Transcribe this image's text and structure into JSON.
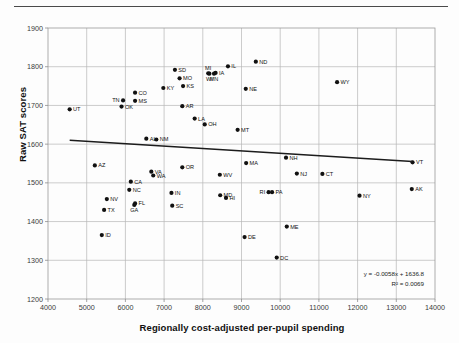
{
  "chart_data": {
    "type": "scatter",
    "title": "",
    "xlabel": "Regionally cost-adjusted per-pupil spending",
    "ylabel": "Raw SAT scores",
    "xlim": [
      4000,
      14000
    ],
    "ylim": [
      1200,
      1900
    ],
    "xticks": [
      4000,
      5000,
      6000,
      7000,
      8000,
      9000,
      10000,
      11000,
      12000,
      13000,
      14000
    ],
    "yticks": [
      1200,
      1300,
      1400,
      1500,
      1600,
      1700,
      1800,
      1900
    ],
    "grid": true,
    "legend": "none",
    "annotations": {
      "trendline_equation": "y = -0.0058x + 1636.8",
      "r_squared": "R² = 0.0069"
    },
    "trendline": {
      "slope": -0.0058,
      "intercept": 1636.8,
      "x_start": 4560,
      "y_start": 1610,
      "x_end": 13420,
      "y_end": 1555
    },
    "point_label_key": "state",
    "points": [
      {
        "state": "UT",
        "x": 4560,
        "y": 1690,
        "label_side": "right"
      },
      {
        "state": "AZ",
        "x": 5210,
        "y": 1545,
        "label_side": "right"
      },
      {
        "state": "NV",
        "x": 5520,
        "y": 1458,
        "label_side": "right"
      },
      {
        "state": "TX",
        "x": 5450,
        "y": 1430,
        "label_side": "right"
      },
      {
        "state": "ID",
        "x": 5390,
        "y": 1365,
        "label_side": "right"
      },
      {
        "state": "TN",
        "x": 5940,
        "y": 1713,
        "label_side": "left"
      },
      {
        "state": "OK",
        "x": 5900,
        "y": 1697,
        "label_side": "right"
      },
      {
        "state": "MS",
        "x": 6250,
        "y": 1712,
        "label_side": "right"
      },
      {
        "state": "CO",
        "x": 6250,
        "y": 1733,
        "label_side": "right"
      },
      {
        "state": "NC",
        "x": 6100,
        "y": 1482,
        "label_side": "right"
      },
      {
        "state": "CA",
        "x": 6140,
        "y": 1503,
        "label_side": "right"
      },
      {
        "state": "FL",
        "x": 6250,
        "y": 1447,
        "label_side": "right"
      },
      {
        "state": "GA",
        "x": 6230,
        "y": 1443,
        "label_side": "below"
      },
      {
        "state": "AL",
        "x": 6540,
        "y": 1614,
        "label_side": "right"
      },
      {
        "state": "NM",
        "x": 6800,
        "y": 1612,
        "label_side": "right"
      },
      {
        "state": "VA",
        "x": 6670,
        "y": 1529,
        "label_side": "right"
      },
      {
        "state": "WA",
        "x": 6720,
        "y": 1519,
        "label_side": "right"
      },
      {
        "state": "KY",
        "x": 6980,
        "y": 1745,
        "label_side": "right"
      },
      {
        "state": "SD",
        "x": 7280,
        "y": 1792,
        "label_side": "right"
      },
      {
        "state": "MO",
        "x": 7400,
        "y": 1770,
        "label_side": "right"
      },
      {
        "state": "KS",
        "x": 7490,
        "y": 1750,
        "label_side": "right"
      },
      {
        "state": "AR",
        "x": 7470,
        "y": 1698,
        "label_side": "right"
      },
      {
        "state": "IN",
        "x": 7190,
        "y": 1474,
        "label_side": "right"
      },
      {
        "state": "SC",
        "x": 7210,
        "y": 1441,
        "label_side": "right"
      },
      {
        "state": "OR",
        "x": 7470,
        "y": 1540,
        "label_side": "right"
      },
      {
        "state": "LA",
        "x": 7790,
        "y": 1666,
        "label_side": "right"
      },
      {
        "state": "OH",
        "x": 8050,
        "y": 1651,
        "label_side": "right"
      },
      {
        "state": "MI",
        "x": 8140,
        "y": 1783,
        "label_side": "above"
      },
      {
        "state": "WI",
        "x": 8170,
        "y": 1782,
        "label_side": "below"
      },
      {
        "state": "IA",
        "x": 8330,
        "y": 1784,
        "label_side": "right"
      },
      {
        "state": "MN",
        "x": 8290,
        "y": 1782,
        "label_side": "below"
      },
      {
        "state": "IL",
        "x": 8650,
        "y": 1801,
        "label_side": "right"
      },
      {
        "state": "ND",
        "x": 9370,
        "y": 1813,
        "label_side": "right"
      },
      {
        "state": "NE",
        "x": 9110,
        "y": 1743,
        "label_side": "right"
      },
      {
        "state": "MT",
        "x": 8900,
        "y": 1637,
        "label_side": "right"
      },
      {
        "state": "WV",
        "x": 8440,
        "y": 1521,
        "label_side": "right"
      },
      {
        "state": "MD",
        "x": 8450,
        "y": 1468,
        "label_side": "right"
      },
      {
        "state": "HI",
        "x": 8600,
        "y": 1461,
        "label_side": "right"
      },
      {
        "state": "MA",
        "x": 9120,
        "y": 1551,
        "label_side": "right"
      },
      {
        "state": "NH",
        "x": 10150,
        "y": 1565,
        "label_side": "right"
      },
      {
        "state": "NJ",
        "x": 10430,
        "y": 1524,
        "label_side": "right"
      },
      {
        "state": "RI",
        "x": 9700,
        "y": 1476,
        "label_side": "left"
      },
      {
        "state": "PA",
        "x": 9790,
        "y": 1476,
        "label_side": "right"
      },
      {
        "state": "CT",
        "x": 11090,
        "y": 1523,
        "label_side": "right"
      },
      {
        "state": "ME",
        "x": 10170,
        "y": 1387,
        "label_side": "right"
      },
      {
        "state": "DE",
        "x": 9080,
        "y": 1360,
        "label_side": "right"
      },
      {
        "state": "DC",
        "x": 9910,
        "y": 1307,
        "label_side": "right"
      },
      {
        "state": "WY",
        "x": 11470,
        "y": 1760,
        "label_side": "right"
      },
      {
        "state": "NY",
        "x": 12050,
        "y": 1467,
        "label_side": "right"
      },
      {
        "state": "VT",
        "x": 13420,
        "y": 1553,
        "label_side": "right"
      },
      {
        "state": "AK",
        "x": 13400,
        "y": 1484,
        "label_side": "right"
      }
    ]
  },
  "style": {
    "dot_color": "#111111",
    "trend_color": "#1c1c1c",
    "grid_color": "#b6b6b6",
    "background": "#fdfdfd"
  }
}
